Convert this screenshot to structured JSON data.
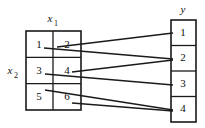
{
  "diagram": {
    "labels": {
      "domain_col": "x",
      "domain_col_sub": "1",
      "domain_row": "x",
      "domain_row_sub": "2",
      "codomain": "y"
    },
    "colors": {
      "ink": "#1a1a1a",
      "text": "#111111",
      "background": "#ffffff"
    },
    "domain_box": {
      "x": 26,
      "y": 31,
      "width": 55,
      "height": 79,
      "cols": 2,
      "rows": 3,
      "cells": [
        {
          "label": "1",
          "col": 0,
          "row": 0,
          "cx": 39,
          "cy": 45
        },
        {
          "label": "2",
          "col": 1,
          "row": 0,
          "cx": 67,
          "cy": 45
        },
        {
          "label": "3",
          "col": 0,
          "row": 1,
          "cx": 39,
          "cy": 71
        },
        {
          "label": "4",
          "col": 1,
          "row": 1,
          "cx": 67,
          "cy": 71
        },
        {
          "label": "5",
          "col": 0,
          "row": 2,
          "cx": 39,
          "cy": 97
        },
        {
          "label": "6",
          "col": 1,
          "row": 2,
          "cx": 67,
          "cy": 97
        }
      ]
    },
    "codomain_box": {
      "x": 171,
      "y": 20,
      "width": 25,
      "height": 102,
      "cells": [
        {
          "label": "1",
          "cx": 183,
          "cy": 33
        },
        {
          "label": "2",
          "cx": 183,
          "cy": 58
        },
        {
          "label": "3",
          "cx": 183,
          "cy": 84
        },
        {
          "label": "4",
          "cx": 183,
          "cy": 109
        }
      ]
    },
    "connections": [
      {
        "from": "2",
        "to": "1",
        "x1": 57,
        "y1": 47,
        "x2": 173,
        "y2": 33
      },
      {
        "from": "1",
        "to": "2",
        "x1": 44,
        "y1": 48,
        "x2": 173,
        "y2": 59
      },
      {
        "from": "4",
        "to": "2",
        "x1": 72,
        "y1": 72,
        "x2": 173,
        "y2": 60
      },
      {
        "from": "3",
        "to": "3",
        "x1": 45,
        "y1": 74,
        "x2": 173,
        "y2": 85
      },
      {
        "from": "5",
        "to": "4",
        "x1": 45,
        "y1": 90,
        "x2": 173,
        "y2": 110
      },
      {
        "from": "6",
        "to": "4",
        "x1": 72,
        "y1": 103,
        "x2": 173,
        "y2": 111
      }
    ]
  }
}
